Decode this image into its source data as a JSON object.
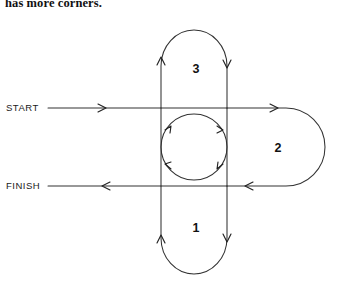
{
  "caption": {
    "text": "has more corners."
  },
  "figure": {
    "type": "flow-loop-diagram",
    "entry_label": "START",
    "exit_label": "FINISH",
    "regions": [
      {
        "id": "region-1",
        "label": "1",
        "position": "bottom"
      },
      {
        "id": "region-2",
        "label": "2",
        "position": "right"
      },
      {
        "id": "region-3",
        "label": "3",
        "position": "top"
      }
    ],
    "center": {
      "name": "central-circle",
      "direction": "counterclockwise",
      "arrow_count": 4
    },
    "colors": {
      "stroke": "#333333",
      "arrow": "#222222",
      "text": "#111111",
      "background": "#ffffff"
    },
    "geometry": {
      "left_rail_x": 161,
      "right_rail_x": 227,
      "top_rail_y": 108,
      "bottom_rail_y": 186,
      "circle_cx": 194,
      "circle_cy": 147,
      "circle_r": 33,
      "top_apex_y": 30,
      "bottom_apex_y": 274,
      "right_apex_x": 325
    }
  }
}
